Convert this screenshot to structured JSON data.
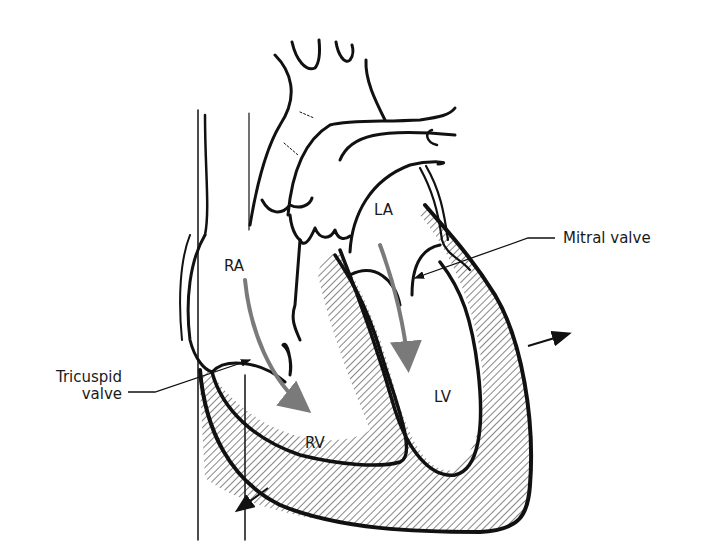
{
  "diagram": {
    "chambers": [
      {
        "id": "ra",
        "label": "RA"
      },
      {
        "id": "la",
        "label": "LA"
      },
      {
        "id": "rv",
        "label": "RV"
      },
      {
        "id": "lv",
        "label": "LV"
      }
    ],
    "callouts": {
      "tricuspid_line1": "Tricuspid",
      "tricuspid_line2": "valve",
      "mitral": "Mitral valve"
    },
    "colors": {
      "outline": "#111111",
      "flow_arrow": "#7a7a7a",
      "hatch": "#222222",
      "background": "#ffffff"
    }
  }
}
